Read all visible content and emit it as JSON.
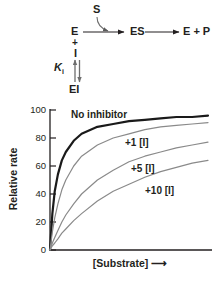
{
  "scheme": {
    "substrate": "S",
    "enzyme": "E",
    "plus": "+",
    "inhibitor": "I",
    "enzyme_inhibitor": "EI",
    "enzyme_substrate": "ES",
    "products": "E + P",
    "ki_symbol": "K",
    "ki_subscript": "i"
  },
  "chart_data": {
    "type": "line",
    "title": "",
    "xlabel": "[Substrate]",
    "ylabel": "Relative rate",
    "xlim": [
      0,
      10
    ],
    "ylim": [
      0,
      100
    ],
    "yticks": [
      0,
      20,
      40,
      60,
      80,
      100
    ],
    "ytick_labels": [
      "0",
      "20",
      "40",
      "60",
      "80",
      "100"
    ],
    "xticks": [],
    "xtick_labels": [],
    "grid": false,
    "legend": "inline-annotations",
    "model": "michaelis-menten competitive inhibition",
    "vmax": 100,
    "x": [
      0,
      0.15,
      0.3,
      0.5,
      0.75,
      1,
      1.5,
      2,
      3,
      4,
      5,
      6,
      7,
      8,
      9,
      10
    ],
    "series": [
      {
        "name": "No inhibitor",
        "km": 0.42,
        "color": "#1a1a1a",
        "width": 2.2,
        "values": [
          0,
          26,
          42,
          54,
          64,
          70,
          78,
          83,
          88,
          90,
          92,
          93,
          94,
          95,
          95,
          96
        ]
      },
      {
        "name": "+1  [I]",
        "km": 1.0,
        "color": "#8a8a8a",
        "width": 1.2,
        "values": [
          0,
          13,
          23,
          33,
          43,
          50,
          60,
          67,
          75,
          80,
          83,
          86,
          88,
          89,
          90,
          91
        ]
      },
      {
        "name": "+5 [I]",
        "km": 3.0,
        "color": "#8a8a8a",
        "width": 1.2,
        "values": [
          0,
          5,
          9,
          14,
          20,
          25,
          33,
          40,
          50,
          57,
          63,
          67,
          70,
          73,
          75,
          77
        ]
      },
      {
        "name": "+10 [I]",
        "km": 5.6,
        "color": "#8a8a8a",
        "width": 1.2,
        "values": [
          0,
          3,
          5,
          8,
          12,
          15,
          21,
          26,
          35,
          42,
          47,
          52,
          56,
          59,
          62,
          64
        ]
      }
    ],
    "annotations": [
      {
        "text": "No inhibitor",
        "series": "No inhibitor"
      },
      {
        "text": "+1  [I]",
        "series": "+1  [I]"
      },
      {
        "text": "+5 [I]",
        "series": "+5 [I]"
      },
      {
        "text": "+10 [I]",
        "series": "+10 [I]"
      }
    ]
  },
  "axis_numbers": {
    "y": [
      "100",
      "80",
      "60",
      "40",
      "20",
      "0"
    ]
  }
}
